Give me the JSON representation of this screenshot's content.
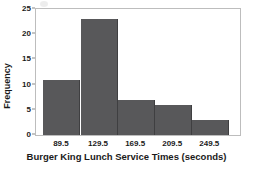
{
  "chart_data": {
    "type": "bar",
    "title": "",
    "subtitle": "",
    "xlabel": "Burger King Lunch Service Times (seconds)",
    "ylabel": "Frequency",
    "categories": [
      "89.5",
      "129.5",
      "169.5",
      "209.5",
      "249.5"
    ],
    "values": [
      11,
      23,
      7,
      6,
      3
    ],
    "bin_width": 40,
    "bin_edges": [
      69.5,
      109.5,
      149.5,
      189.5,
      229.5,
      269.5
    ],
    "x_tick_labels": [
      "89.5",
      "129.5",
      "169.5",
      "209.5",
      "249.5"
    ],
    "x_tick_values": [
      89.5,
      129.5,
      169.5,
      209.5,
      249.5
    ],
    "xlim": [
      61.5,
      281.5
    ],
    "y_tick_labels": [
      "0",
      "5",
      "10",
      "15",
      "20",
      "25"
    ],
    "y_tick_values": [
      0,
      5,
      10,
      15,
      20,
      25
    ],
    "ylim": [
      0,
      25
    ],
    "grid": false,
    "legend": false,
    "legend_position": "none",
    "bar_color": "#58585a",
    "bar_edge_color": "#3f3f41",
    "frame_color": "#bdbdbd",
    "text_color": "#1a1a1a"
  }
}
